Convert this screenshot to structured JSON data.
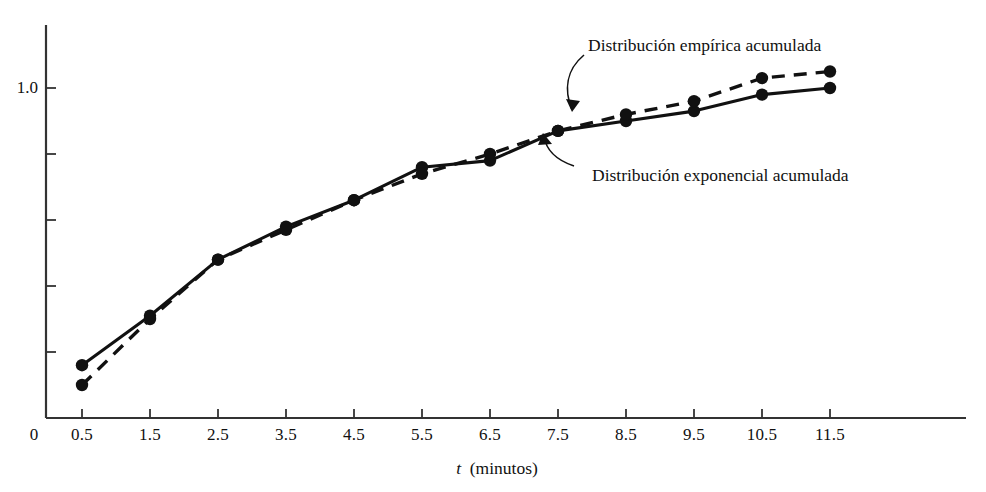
{
  "chart_data": {
    "type": "line",
    "title": "",
    "xlabel": "t (minutos)",
    "ylabel": "",
    "x": [
      0.5,
      1.5,
      2.5,
      3.5,
      4.5,
      5.5,
      6.5,
      7.5,
      8.5,
      9.5,
      10.5,
      11.5
    ],
    "xtick_labels": [
      "0.5",
      "1.5",
      "2.5",
      "3.5",
      "4.5",
      "5.5",
      "6.5",
      "7.5",
      "8.5",
      "9.5",
      "10.5",
      "11.5"
    ],
    "xlim": [
      0,
      12.5
    ],
    "ytick_labels": [
      "0",
      "1.0"
    ],
    "ylim": [
      0,
      1.1
    ],
    "y_origin_label": "0",
    "y_one_label": "1.0",
    "grid": false,
    "legend_position": "annotations",
    "series": [
      {
        "name": "Distribución empírica acumulada",
        "style": "solid",
        "marker": "filled-circle",
        "values": [
          0.1,
          0.3,
          0.48,
          0.57,
          0.66,
          0.74,
          0.8,
          0.87,
          0.92,
          0.96,
          1.03,
          1.05
        ]
      },
      {
        "name": "Distribución exponencial acumulada",
        "style": "dashed",
        "marker": "filled-circle",
        "values": [
          0.16,
          0.31,
          0.48,
          0.58,
          0.66,
          0.76,
          0.78,
          0.87,
          0.9,
          0.93,
          0.98,
          1.0
        ]
      }
    ],
    "annotations": [
      {
        "id": "empirical-label",
        "text": "Distribución empírica acumulada",
        "target_x": 7.5,
        "target_y": 0.87
      },
      {
        "id": "exponential-label",
        "text": "Distribución exponencial acumulada",
        "target_x": 6.9,
        "target_y": 0.79
      }
    ],
    "colors": {
      "line": "#111111",
      "marker": "#111111",
      "axis": "#444444",
      "background": "#ffffff"
    }
  }
}
